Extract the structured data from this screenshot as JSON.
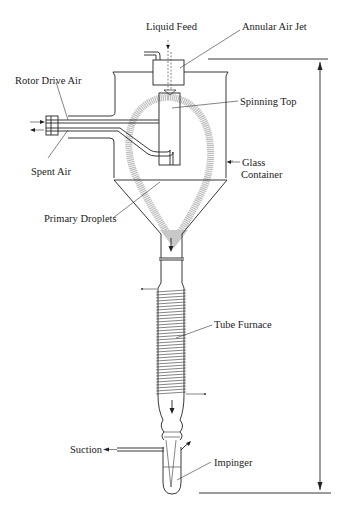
{
  "figure": {
    "type": "schematic"
  },
  "labels": {
    "liquid_feed": "Liquid Feed",
    "annular_air_jet": "Annular Air Jet",
    "rotor_drive_air": "Rotor Drive Air",
    "spinning_top": "Spinning Top",
    "spent_air": "Spent Air",
    "glass_container_line1": "Glass",
    "glass_container_line2": "Container",
    "primary_droplets": "Primary Droplets",
    "tube_furnace": "Tube Furnace",
    "suction": "Suction",
    "impinger": "Impinger"
  },
  "colors": {
    "line": "#222222",
    "spray": "#b5b5b5",
    "background": "#ffffff"
  }
}
